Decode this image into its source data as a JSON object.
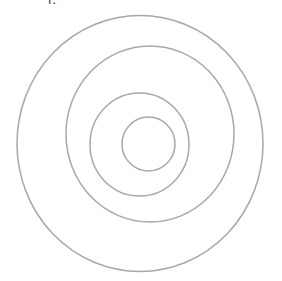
{
  "diagram": {
    "title_fragment": "i:",
    "stroke_color": "#a8a8a8",
    "rings": [
      {
        "name": "outer-ring",
        "order": 1
      },
      {
        "name": "second-ring",
        "order": 2
      },
      {
        "name": "third-ring",
        "order": 3
      },
      {
        "name": "inner-ring",
        "order": 4
      }
    ]
  }
}
